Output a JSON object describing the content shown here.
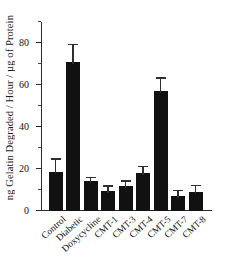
{
  "chart_data": {
    "type": "bar",
    "title": "",
    "xlabel": "",
    "ylabel": "ng Gelatin Degraded / Hour / µg of Protein",
    "categories": [
      "Control",
      "Diabetic",
      "Doxycycline",
      "CMT-1",
      "CMT-3",
      "CMT-4",
      "CMT-5",
      "CMT-7",
      "CMT-8"
    ],
    "values": [
      18.5,
      71,
      14.3,
      9.3,
      12,
      18,
      57,
      7,
      9
    ],
    "errors": [
      6,
      8,
      1.3,
      2.3,
      2,
      3,
      6,
      2.3,
      3
    ],
    "ylim": [
      0,
      90
    ],
    "yticks": [
      0,
      20,
      40,
      60,
      80
    ],
    "ytick_labels": [
      "0",
      "20",
      "40",
      "60",
      "80"
    ],
    "yminor_ticks": [
      10,
      30,
      50,
      70,
      90
    ],
    "grid": false,
    "legend": false,
    "bar_color": "#111111",
    "error_color": "#2f2f2f",
    "axis_color": "#2b2b2b"
  }
}
